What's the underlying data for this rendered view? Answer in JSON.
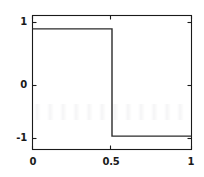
{
  "figure": {
    "background_color": "#ffffff",
    "axis_color": "#1a1a1a",
    "line_color": "#2b2b2b"
  },
  "chart_data": {
    "type": "line",
    "title": "",
    "subtitle": "",
    "xlabel": "",
    "ylabel": "",
    "xlim": [
      0,
      1
    ],
    "ylim": [
      -1.25,
      1.25
    ],
    "grid": false,
    "legend": null,
    "legend_position": "none",
    "xticks": [
      0,
      0.5,
      1
    ],
    "xticklabels": [
      "0",
      "0.5",
      "1"
    ],
    "yticks": [
      -1,
      0,
      1
    ],
    "yticklabels": [
      "-1",
      "0",
      "1"
    ],
    "series": [
      {
        "name": "square wave",
        "x": [
          0,
          0.5,
          0.5,
          1
        ],
        "values": [
          1,
          1,
          -1,
          -1
        ]
      }
    ],
    "annotations": []
  },
  "axes": {
    "ytick_labels": [
      {
        "text": "1",
        "value": 1
      },
      {
        "text": "0",
        "value": 0
      },
      {
        "text": "-1",
        "value": -1
      }
    ],
    "xtick_labels": [
      {
        "text": "0",
        "value": 0
      },
      {
        "text": "0.5",
        "value": 0.5
      },
      {
        "text": "1",
        "value": 1
      }
    ]
  }
}
